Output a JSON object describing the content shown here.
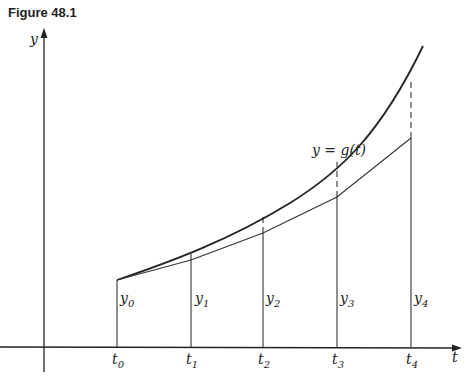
{
  "figure": {
    "title": "Figure 48.1",
    "y_axis_label": "y",
    "x_axis_label": "t",
    "curve_label": "y = g(t)",
    "t_labels": [
      {
        "base": "t",
        "sub": "0"
      },
      {
        "base": "t",
        "sub": "1"
      },
      {
        "base": "t",
        "sub": "2"
      },
      {
        "base": "t",
        "sub": "3"
      },
      {
        "base": "t",
        "sub": "4"
      }
    ],
    "y_labels": [
      {
        "base": "y",
        "sub": "0"
      },
      {
        "base": "y",
        "sub": "1"
      },
      {
        "base": "y",
        "sub": "2"
      },
      {
        "base": "y",
        "sub": "3"
      },
      {
        "base": "y",
        "sub": "4"
      }
    ]
  },
  "colors": {
    "ink": "#222222",
    "background": "#ffffff"
  }
}
